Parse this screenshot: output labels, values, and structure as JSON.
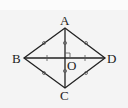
{
  "figure": {
    "shape": "rhombus ABCD with diagonals AC and BD intersecting at O",
    "points": {
      "A": {
        "label": "A"
      },
      "B": {
        "label": "B"
      },
      "C": {
        "label": "C"
      },
      "D": {
        "label": "D"
      },
      "O": {
        "label": "O"
      }
    },
    "right_angle_at": "O",
    "colors": {
      "line": "#222222",
      "background": "#f4f4f4"
    }
  }
}
